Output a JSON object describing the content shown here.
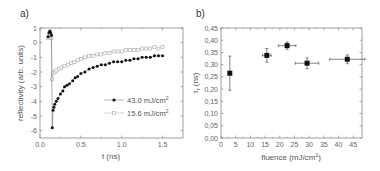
{
  "chart_data": [
    {
      "panel": "a)",
      "type": "scatter",
      "xlabel": "t (ns)",
      "ylabel": "reflectivity (arb. units)",
      "xlim": [
        0.0,
        1.75
      ],
      "ylim": [
        -6.5,
        1.0
      ],
      "xticks": [
        "0.0",
        "0.5",
        "1.0",
        "1.5"
      ],
      "yticks": [
        "1",
        "0",
        "-1",
        "-2",
        "-3",
        "-4",
        "-5",
        "-6"
      ],
      "grid": false,
      "legend_position": "lower right",
      "series": [
        {
          "name": "43.0 mJ/cm²",
          "marker": "filled-circle",
          "color": "#111111",
          "x": [
            0.1,
            0.11,
            0.12,
            0.13,
            0.14,
            0.15,
            0.16,
            0.17,
            0.18,
            0.2,
            0.22,
            0.25,
            0.28,
            0.3,
            0.33,
            0.36,
            0.4,
            0.43,
            0.46,
            0.5,
            0.55,
            0.6,
            0.65,
            0.7,
            0.75,
            0.8,
            0.85,
            0.9,
            0.95,
            1.0,
            1.05,
            1.1,
            1.15,
            1.2,
            1.25,
            1.3,
            1.35,
            1.4,
            1.45,
            1.5
          ],
          "y": [
            0.4,
            0.7,
            0.8,
            0.7,
            0.5,
            -5.8,
            -4.6,
            -4.4,
            -4.2,
            -4.0,
            -3.8,
            -3.5,
            -3.3,
            -3.0,
            -2.9,
            -2.8,
            -2.6,
            -2.4,
            -2.3,
            -2.1,
            -2.0,
            -1.8,
            -1.7,
            -1.6,
            -1.5,
            -1.5,
            -1.4,
            -1.3,
            -1.3,
            -1.3,
            -1.2,
            -1.2,
            -1.1,
            -1.1,
            -1.0,
            -1.0,
            -1.0,
            -0.9,
            -0.9,
            -0.9
          ]
        },
        {
          "name": "15.6 mJ/cm²",
          "marker": "open-square",
          "color": "#aaaaaa",
          "x": [
            0.1,
            0.11,
            0.12,
            0.13,
            0.14,
            0.15,
            0.16,
            0.18,
            0.2,
            0.23,
            0.26,
            0.3,
            0.34,
            0.38,
            0.42,
            0.46,
            0.5,
            0.55,
            0.6,
            0.65,
            0.7,
            0.75,
            0.8,
            0.85,
            0.9,
            0.95,
            1.0,
            1.05,
            1.1,
            1.15,
            1.2,
            1.25,
            1.3,
            1.35,
            1.4,
            1.45,
            1.5
          ],
          "y": [
            0.3,
            0.5,
            0.6,
            0.5,
            0.3,
            -2.5,
            -2.1,
            -2.0,
            -1.9,
            -1.8,
            -1.7,
            -1.6,
            -1.5,
            -1.4,
            -1.3,
            -1.2,
            -1.1,
            -1.0,
            -0.9,
            -0.9,
            -0.8,
            -0.8,
            -0.7,
            -0.7,
            -0.6,
            -0.6,
            -0.6,
            -0.5,
            -0.5,
            -0.5,
            -0.5,
            -0.4,
            -0.4,
            -0.4,
            -0.3,
            -0.4,
            -0.3
          ]
        }
      ]
    },
    {
      "panel": "b)",
      "type": "scatter",
      "xlabel": "fluence (mJ/cm²)",
      "ylabel": "τᵣ (ns)",
      "xlim": [
        0,
        48
      ],
      "ylim": [
        0.0,
        0.45
      ],
      "xticks": [
        "0",
        "5",
        "10",
        "15",
        "20",
        "25",
        "30",
        "35",
        "40",
        "45"
      ],
      "yticks": [
        "0,00",
        "0,05",
        "0,10",
        "0,15",
        "0,20",
        "0,25",
        "0,30",
        "0,35",
        "0,40",
        "0,45"
      ],
      "grid": false,
      "series": [
        {
          "name": "tau_r",
          "marker": "filled-square",
          "color": "#111111",
          "x": [
            3.0,
            15.6,
            22.5,
            29.3,
            43.0
          ],
          "y": [
            0.265,
            0.338,
            0.378,
            0.306,
            0.322
          ],
          "xerr": [
            0.0,
            1.5,
            3.0,
            4.0,
            6.0
          ],
          "yerr": [
            0.07,
            0.028,
            0.015,
            0.022,
            0.018
          ]
        }
      ]
    }
  ],
  "panels": {
    "a": {
      "label": "a)",
      "xlabel": "t (ns)",
      "ylabel": "reflectivity (arb. units)",
      "legend": [
        "43.0 mJ/cm",
        "15.6 mJ/cm"
      ],
      "legend_sup": "2"
    },
    "b": {
      "label": "b)",
      "xlabel_main": "fluence (mJ/cm",
      "xlabel_sup": "2",
      "xlabel_end": ")",
      "ylabel_main": "τ",
      "ylabel_sub": "r",
      "ylabel_end": " (ns)"
    }
  }
}
